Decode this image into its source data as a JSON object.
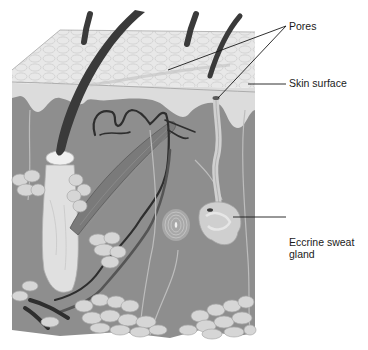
{
  "diagram": {
    "labels": {
      "pores": "Pores",
      "skin_surface": "Skin surface",
      "eccrine_sweat_gland": "Eccrine sweat gland"
    },
    "structures": [
      "hair shaft",
      "hair follicle",
      "epidermis",
      "dermis",
      "arrector pili muscle",
      "blood vessels",
      "nerve fibers",
      "lamellated corpuscle",
      "eccrine sweat gland",
      "sweat duct",
      "adipose tissue"
    ],
    "colors": {
      "background": "#ffffff",
      "epidermis": "#e6e6e6",
      "epidermis_cells": "#cfcfcf",
      "papillary_layer": "#dadada",
      "dermis": "#8c8c8c",
      "hair": "#3a3a3a",
      "follicle": "#d8d8d8",
      "fat": "#d4d4d4",
      "vessel_dark": "#2e2e2e",
      "vessel_mid": "#555555",
      "muscle": "#7a7a7a",
      "nerve": "#bdbdbd",
      "leader_line": "#1a1a1a"
    }
  }
}
